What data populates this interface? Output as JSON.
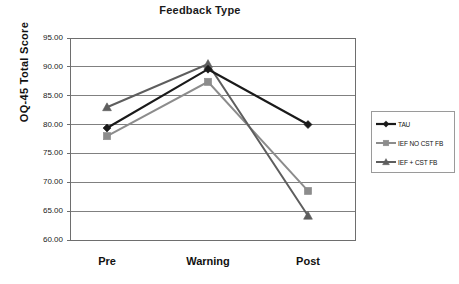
{
  "chart_data": {
    "type": "line",
    "title": "Feedback Type",
    "xlabel": "",
    "ylabel": "OQ-45 Total Score",
    "categories": [
      "Pre",
      "Warning",
      "Post"
    ],
    "ylim": [
      60.0,
      95.0
    ],
    "ytick_step": 5.0,
    "ytick_labels": [
      "95.00",
      "90.00",
      "85.00",
      "80.00",
      "75.00",
      "70.00",
      "65.00",
      "60.00"
    ],
    "ytick_values": [
      95.0,
      90.0,
      85.0,
      80.0,
      75.0,
      70.0,
      65.0,
      60.0
    ],
    "grid": true,
    "legend_position": "right",
    "series": [
      {
        "name": "TAU",
        "values": [
          79.4,
          89.6,
          80.0
        ],
        "color": "#1a1a1a",
        "marker": "diamond"
      },
      {
        "name": "IEF NO CST FB",
        "values": [
          78.0,
          87.4,
          68.5
        ],
        "color": "#8c8c8c",
        "marker": "square"
      },
      {
        "name": "IEF + CST FB",
        "values": [
          83.0,
          90.5,
          64.2
        ],
        "color": "#5e5e5e",
        "marker": "triangle"
      }
    ]
  },
  "title": {
    "text": "Feedback Type"
  },
  "axes": {
    "y_title": "OQ-45 Total Score"
  },
  "legend": {
    "items": [
      {
        "label": "TAU"
      },
      {
        "label": "IEF NO CST FB"
      },
      {
        "label": "IEF + CST FB"
      }
    ]
  },
  "colors": {
    "plot_border": "#6e6e6e",
    "gridline": "#808080",
    "background": "#ffffff",
    "series_tau": "#1a1a1a",
    "series_ief_no_cst": "#8c8c8c",
    "series_ief_cst": "#5e5e5e"
  }
}
